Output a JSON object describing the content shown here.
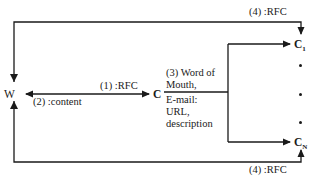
{
  "diagram": {
    "nodes": {
      "w": {
        "label": "W"
      },
      "c": {
        "label": "C"
      },
      "c1": {
        "label": "C",
        "subscript": "1"
      },
      "cn": {
        "label": "C",
        "subscript": "N"
      }
    },
    "edges": {
      "step1": {
        "label": "(1) :RFC",
        "from": "W",
        "to": "C"
      },
      "step2": {
        "label": "(2) :content",
        "from": "C",
        "to": "W"
      },
      "step3": {
        "lines": [
          "(3) Word of",
          "Mouth,",
          "E-mail:",
          "URL,",
          "description"
        ],
        "from": "C",
        "to": [
          "C1",
          "CN"
        ]
      },
      "step4_top": {
        "label": "(4) :RFC",
        "from": "W",
        "to": "C1"
      },
      "step4_bottom": {
        "label": "(4) :RFC",
        "from": "W",
        "to": "CN"
      }
    },
    "ellipsis": [
      "•",
      "•",
      "•"
    ],
    "colors": {
      "line": "#1a1a1a",
      "background": "#ffffff"
    }
  }
}
